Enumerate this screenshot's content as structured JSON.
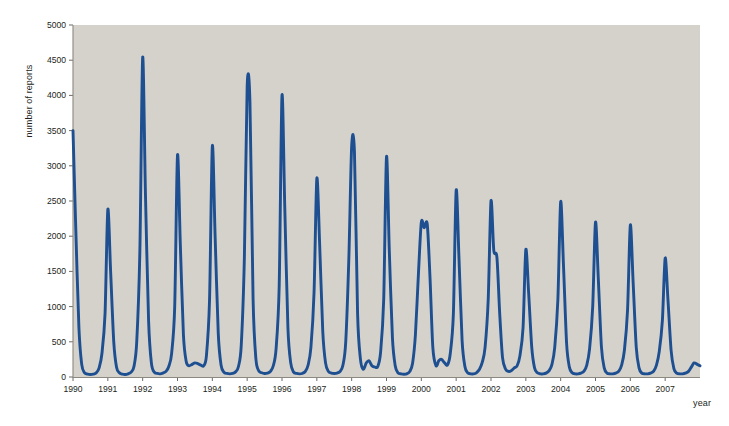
{
  "chart_data": {
    "type": "line",
    "title": "",
    "xlabel": "year",
    "ylabel": "number of reports",
    "xlim": [
      1990.0,
      2008.0
    ],
    "ylim": [
      0,
      5000
    ],
    "grid": false,
    "legend": "none",
    "line_color": "#1d4f91",
    "plot_background": "#d5d2cc",
    "page_background": "#ffffff",
    "x_tick_labels": [
      "1990",
      "1991",
      "1992",
      "1993",
      "1994",
      "1995",
      "1996",
      "1997",
      "1998",
      "1999",
      "2000",
      "2001",
      "2002",
      "2003",
      "2004",
      "2005",
      "2006",
      "2007"
    ],
    "x_tick_values": [
      1990,
      1991,
      1992,
      1993,
      1994,
      1995,
      1996,
      1997,
      1998,
      1999,
      2000,
      2001,
      2002,
      2003,
      2004,
      2005,
      2006,
      2007
    ],
    "y_tick_labels": [
      "0",
      "500",
      "1000",
      "1500",
      "2000",
      "2500",
      "3000",
      "3500",
      "4000",
      "4500",
      "5000"
    ],
    "y_tick_values": [
      0,
      500,
      1000,
      1500,
      2000,
      2500,
      3000,
      3500,
      4000,
      4500,
      5000
    ],
    "annual_peak_values": [
      3500,
      2380,
      4540,
      3150,
      3280,
      4130,
      4000,
      2820,
      3280,
      3130,
      2200,
      2650,
      2500,
      1810,
      2490,
      2200,
      2160,
      1690
    ],
    "annual_peak_years": [
      1990,
      1991,
      1992,
      1993,
      1994,
      1995,
      1996,
      1997,
      1998,
      1999,
      2000,
      2001,
      2002,
      2003,
      2004,
      2005,
      2006,
      2007
    ],
    "series": [
      {
        "name": "number of reports",
        "x": [
          1990.0,
          1990.08,
          1990.17,
          1990.25,
          1990.33,
          1990.42,
          1990.5,
          1990.58,
          1990.67,
          1990.75,
          1990.83,
          1990.92,
          1991.0,
          1991.08,
          1991.17,
          1991.25,
          1991.33,
          1991.42,
          1991.5,
          1991.58,
          1991.67,
          1991.75,
          1991.83,
          1991.92,
          1992.0,
          1992.08,
          1992.17,
          1992.25,
          1992.33,
          1992.42,
          1992.5,
          1992.58,
          1992.67,
          1992.75,
          1992.83,
          1992.92,
          1993.0,
          1993.08,
          1993.17,
          1993.25,
          1993.33,
          1993.42,
          1993.5,
          1993.58,
          1993.67,
          1993.75,
          1993.83,
          1993.92,
          1994.0,
          1994.08,
          1994.17,
          1994.25,
          1994.33,
          1994.42,
          1994.5,
          1994.58,
          1994.67,
          1994.75,
          1994.83,
          1994.92,
          1995.0,
          1995.08,
          1995.17,
          1995.25,
          1995.33,
          1995.42,
          1995.5,
          1995.58,
          1995.67,
          1995.75,
          1995.83,
          1995.92,
          1996.0,
          1996.08,
          1996.17,
          1996.25,
          1996.33,
          1996.42,
          1996.5,
          1996.58,
          1996.67,
          1996.75,
          1996.83,
          1996.92,
          1997.0,
          1997.08,
          1997.17,
          1997.25,
          1997.33,
          1997.42,
          1997.5,
          1997.58,
          1997.67,
          1997.75,
          1997.83,
          1997.92,
          1998.0,
          1998.08,
          1998.17,
          1998.25,
          1998.33,
          1998.42,
          1998.5,
          1998.58,
          1998.67,
          1998.75,
          1998.83,
          1998.92,
          1999.0,
          1999.08,
          1999.17,
          1999.25,
          1999.33,
          1999.42,
          1999.5,
          1999.58,
          1999.67,
          1999.75,
          1999.83,
          1999.92,
          2000.0,
          2000.08,
          2000.17,
          2000.25,
          2000.33,
          2000.42,
          2000.5,
          2000.58,
          2000.67,
          2000.75,
          2000.83,
          2000.92,
          2001.0,
          2001.08,
          2001.17,
          2001.25,
          2001.33,
          2001.42,
          2001.5,
          2001.58,
          2001.67,
          2001.75,
          2001.83,
          2001.92,
          2002.0,
          2002.08,
          2002.17,
          2002.25,
          2002.33,
          2002.42,
          2002.5,
          2002.58,
          2002.67,
          2002.75,
          2002.83,
          2002.92,
          2003.0,
          2003.08,
          2003.17,
          2003.25,
          2003.33,
          2003.42,
          2003.5,
          2003.58,
          2003.67,
          2003.75,
          2003.83,
          2003.92,
          2004.0,
          2004.08,
          2004.17,
          2004.25,
          2004.33,
          2004.42,
          2004.5,
          2004.58,
          2004.67,
          2004.75,
          2004.83,
          2004.92,
          2005.0,
          2005.08,
          2005.17,
          2005.25,
          2005.33,
          2005.42,
          2005.5,
          2005.58,
          2005.67,
          2005.75,
          2005.83,
          2005.92,
          2006.0,
          2006.08,
          2006.17,
          2006.25,
          2006.33,
          2006.42,
          2006.5,
          2006.58,
          2006.67,
          2006.75,
          2006.83,
          2006.92,
          2007.0,
          2007.08,
          2007.17,
          2007.25,
          2007.33,
          2007.42,
          2007.5,
          2007.58,
          2007.67,
          2007.75,
          2007.83,
          2007.92,
          2008.0
        ],
        "values": [
          3500,
          2100,
          700,
          180,
          60,
          40,
          35,
          40,
          60,
          130,
          330,
          900,
          2380,
          1500,
          500,
          140,
          60,
          40,
          35,
          45,
          70,
          150,
          500,
          1800,
          4540,
          2600,
          800,
          200,
          70,
          50,
          45,
          55,
          80,
          150,
          330,
          1000,
          3150,
          1900,
          600,
          220,
          160,
          180,
          200,
          190,
          170,
          160,
          300,
          1100,
          3280,
          2000,
          620,
          170,
          70,
          50,
          45,
          50,
          75,
          150,
          450,
          1700,
          4130,
          3900,
          1100,
          260,
          90,
          60,
          50,
          55,
          80,
          160,
          400,
          1300,
          4000,
          2400,
          700,
          200,
          70,
          50,
          45,
          50,
          80,
          170,
          420,
          1200,
          2820,
          1900,
          650,
          200,
          80,
          55,
          50,
          55,
          80,
          170,
          500,
          1700,
          3280,
          3200,
          900,
          260,
          110,
          200,
          230,
          160,
          140,
          150,
          350,
          1100,
          3130,
          1800,
          560,
          160,
          60,
          45,
          40,
          45,
          80,
          200,
          600,
          1500,
          2200,
          2120,
          2170,
          1400,
          420,
          160,
          230,
          250,
          200,
          170,
          330,
          900,
          2650,
          1700,
          520,
          150,
          60,
          45,
          45,
          60,
          110,
          210,
          420,
          1100,
          2500,
          1800,
          1700,
          900,
          280,
          110,
          80,
          90,
          130,
          160,
          300,
          700,
          1810,
          1200,
          420,
          130,
          60,
          45,
          45,
          55,
          90,
          180,
          420,
          1100,
          2490,
          1600,
          480,
          140,
          60,
          45,
          45,
          55,
          85,
          170,
          400,
          1000,
          2200,
          1400,
          430,
          130,
          55,
          45,
          45,
          55,
          85,
          170,
          380,
          950,
          2160,
          1350,
          420,
          130,
          55,
          45,
          45,
          55,
          85,
          170,
          360,
          800,
          1690,
          1100,
          380,
          120,
          55,
          45,
          45,
          55,
          80,
          140,
          200,
          180,
          160
        ]
      }
    ]
  },
  "figure": {
    "ylabel_text": "number of reports",
    "xlabel_text": "year"
  }
}
